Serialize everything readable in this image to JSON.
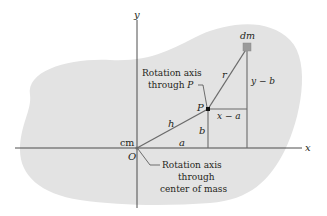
{
  "diagram": {
    "type": "parallel-axis-theorem",
    "colors": {
      "body_fill": "#e3e3e3",
      "axis_line": "#3a3a3a",
      "vector_line": "#6b6b6b",
      "dm_square": "#9a9a9a",
      "text": "#231f20",
      "background": "#ffffff"
    },
    "axes": {
      "x_label": "x",
      "y_label": "y"
    },
    "points": {
      "origin_label": "O",
      "cm_label": "cm",
      "p_label": "P",
      "dm_label": "dm"
    },
    "segments": {
      "h": "h",
      "r": "r",
      "a": "a",
      "b": "b",
      "x_minus_a": "x − a",
      "y_minus_b": "y − b"
    },
    "callouts": {
      "axis_p_line1": "Rotation axis",
      "axis_p_line2": "through P",
      "axis_p_line2_prefix": "through ",
      "axis_p_line2_var": "P",
      "axis_cm_line1": "Rotation axis",
      "axis_cm_line2": "through",
      "axis_cm_line3": "center of mass"
    }
  }
}
